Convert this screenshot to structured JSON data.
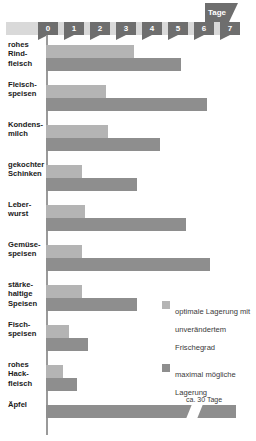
{
  "axis": {
    "unit_label": "Tage",
    "ticks": [
      "0",
      "1",
      "2",
      "3",
      "4",
      "5",
      "6",
      "7"
    ]
  },
  "legend": {
    "items": [
      {
        "swatch": "optimal-swatch",
        "label": "optimale Lagerung mit unverändertem Frischegrad",
        "color": "#b4b4b4"
      },
      {
        "swatch": "maximum-swatch",
        "label": "maximal mögliche Lagerung",
        "color": "#8e8e8e"
      }
    ]
  },
  "annotations": {
    "apfel_note": "ca. 30 Tage"
  },
  "chart_data": {
    "type": "bar",
    "orientation": "horizontal",
    "title": "",
    "xlabel": "Tage",
    "ylabel": "",
    "xlim": [
      0,
      7
    ],
    "grid": false,
    "legend_position": "right",
    "categories": [
      "rohes Rindfleisch",
      "Fleischspeisen",
      "Kondensmilch",
      "gekochter Schinken",
      "Leberwurst",
      "Gemüsespeisen",
      "stärkehaltige Speisen",
      "Fischspeisen",
      "rohes Hackfleisch",
      "Äpfel"
    ],
    "category_labels": [
      [
        "rohes",
        "Rind-",
        "fleisch"
      ],
      [
        "Fleisch-",
        "speisen"
      ],
      [
        "Kondens-",
        "milch"
      ],
      [
        "gekochter",
        "Schinken"
      ],
      [
        "Leber-",
        "wurst"
      ],
      [
        "Gemüse-",
        "speisen"
      ],
      [
        "stärke-",
        "haltige",
        "Speisen"
      ],
      [
        "Fisch-",
        "speisen"
      ],
      [
        "rohes",
        "Hack-",
        "fleisch"
      ],
      [
        "Äpfel"
      ]
    ],
    "series": [
      {
        "name": "optimale Lagerung mit unverändertem Frischegrad",
        "color": "#b4b4b4",
        "values": [
          3.4,
          2.3,
          2.4,
          1.4,
          1.5,
          1.4,
          1.4,
          0.9,
          0.65,
          null
        ]
      },
      {
        "name": "maximal mögliche Lagerung",
        "color": "#8e8e8e",
        "values": [
          5.2,
          6.2,
          4.4,
          3.5,
          5.4,
          6.3,
          3.5,
          1.6,
          1.2,
          30
        ]
      }
    ],
    "notes": [
      {
        "category": "Äpfel",
        "text": "ca. 30 Tage",
        "axis_break": true
      }
    ]
  }
}
